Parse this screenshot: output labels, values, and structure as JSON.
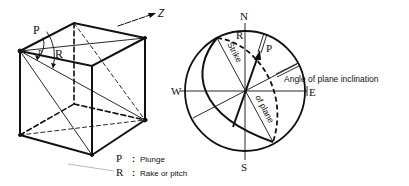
{
  "diagram": {
    "cube": {
      "labels": {
        "plunge_angle": "P",
        "rake_angle": "R",
        "z_axis": "Z"
      }
    },
    "stereonet": {
      "compass": {
        "north": "N",
        "south": "S",
        "west": "W",
        "east": "E"
      },
      "labels": {
        "rake": "R",
        "plunge": "P",
        "strike": "Strike",
        "of_plane": "of plane",
        "inclination": "Angle of plane inclination"
      }
    },
    "legend": [
      {
        "symbol": "P",
        "separator": ":",
        "text": "Plunge"
      },
      {
        "symbol": "R",
        "separator": ":",
        "text": "Rake or pitch"
      }
    ]
  }
}
